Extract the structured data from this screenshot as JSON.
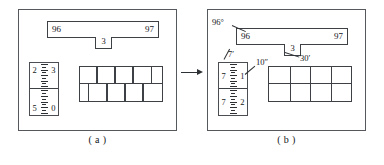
{
  "figure": {
    "panels": [
      {
        "id": "a",
        "caption": "( a )",
        "bar": {
          "left_value": "96",
          "right_value": "97",
          "tab_value": "3"
        },
        "ruler": {
          "top_left": "2",
          "top_right": "3",
          "bottom_left": "5",
          "bottom_right": "0"
        },
        "bricks": {
          "layout": "staggered",
          "rows": 2,
          "top_row_divider_percents": [
            20,
            42,
            64,
            86
          ],
          "bottom_row_divider_percents": [
            10,
            32,
            54,
            76
          ]
        },
        "annotations": []
      },
      {
        "id": "b",
        "caption": "( b )",
        "bar": {
          "left_value": "96",
          "right_value": "97",
          "tab_value": "3"
        },
        "ruler": {
          "top_left": "7",
          "top_right": "1",
          "bottom_left": "7",
          "bottom_right": "2"
        },
        "bricks": {
          "layout": "aligned",
          "rows": 2,
          "top_row_divider_percents": [
            25,
            50,
            75
          ],
          "bottom_row_divider_percents": [
            25,
            50,
            75
          ]
        },
        "annotations": [
          {
            "name": "degrees-label",
            "text": "96°"
          },
          {
            "name": "minutes-label",
            "text": "30′"
          },
          {
            "name": "feet-label",
            "text": "7′"
          },
          {
            "name": "inches-label",
            "text": "10″"
          }
        ]
      }
    ],
    "arrow": {
      "direction": "right",
      "name": "transition-arrow"
    },
    "colors": {
      "stroke": "#3d4044",
      "panel_border": "#55585c",
      "text": "#15171a",
      "background": "#ffffff"
    }
  }
}
